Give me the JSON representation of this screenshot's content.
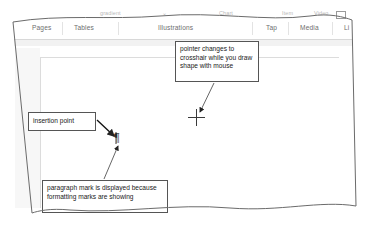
{
  "app": {
    "name": "Microsoft Word Ribbon Insert Tab Screenshot",
    "type": "annotated-screenshot"
  },
  "ribbon": {
    "partial_top_labels": [
      {
        "text": "gradient",
        "x": 86,
        "y": 0
      },
      {
        "text": "⌄",
        "x": 148,
        "y": 0
      },
      {
        "text": "Chart",
        "x": 205,
        "y": 0
      },
      {
        "text": "Item",
        "x": 268,
        "y": 0
      },
      {
        "text": "Video",
        "x": 300,
        "y": 0
      }
    ],
    "groups": [
      {
        "label": "Pages",
        "x": 18
      },
      {
        "label": "Tables",
        "x": 60
      },
      {
        "label": "Illustrations",
        "x": 144
      },
      {
        "label": "Tap",
        "x": 252
      },
      {
        "label": "Media",
        "x": 286
      },
      {
        "label": "Li",
        "x": 330
      }
    ],
    "separators": [
      48,
      104,
      238,
      274,
      318
    ],
    "video_icon": {
      "name": "video-icon",
      "x": 322,
      "y": 1
    }
  },
  "callouts": [
    {
      "id": "pointer",
      "name": "callout-pointer-crosshair",
      "text": "pointer changes to crosshair while you draw shape with mouse"
    },
    {
      "id": "insertion",
      "name": "callout-insertion-point",
      "text": "insertion point"
    },
    {
      "id": "paragraph",
      "name": "callout-paragraph-mark",
      "text": "paragraph mark is displayed because formatting marks are showing"
    }
  ],
  "markers": {
    "crosshair_label": "crosshair-cursor",
    "pilcrow_glyph": "¶",
    "insertion_point_label": "text-insertion-caret"
  },
  "colors": {
    "frame_border": "#6b6b6b",
    "callout_border": "#555555",
    "ribbon_group_text": "#6e6e6e",
    "ribbon_faded_text": "#b9b9b9",
    "page_background": "#ffffff",
    "gutter": "#f7f7f7",
    "arrow": "#222222"
  }
}
